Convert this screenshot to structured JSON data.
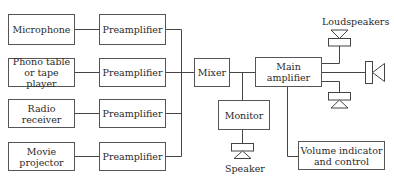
{
  "diagram": {
    "sources": [
      {
        "label": "Microphone"
      },
      {
        "label": "Phono table\nor tape player"
      },
      {
        "label": "Radio\nreceiver"
      },
      {
        "label": "Movie\nprojector"
      }
    ],
    "preamps": [
      {
        "label": "Preamplifier"
      },
      {
        "label": "Preamplifier"
      },
      {
        "label": "Preamplifier"
      },
      {
        "label": "Preamplifier"
      }
    ],
    "mixer": {
      "label": "Mixer"
    },
    "main_amplifier": {
      "label": "Main\namplifier"
    },
    "monitor": {
      "label": "Monitor"
    },
    "volume": {
      "label": "Volume indicator\nand control"
    },
    "loudspeakers_label": "Loudspeakers",
    "speaker_label": "Speaker"
  }
}
